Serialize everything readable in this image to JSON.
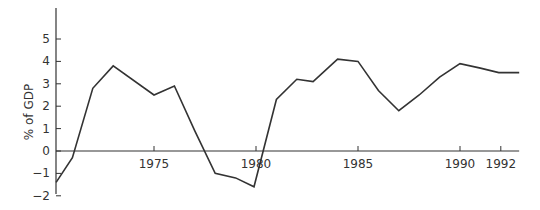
{
  "chart_data": {
    "type": "line",
    "title": "",
    "xlabel": "",
    "ylabel": "% of GDP",
    "xlim": [
      1970.2,
      1992.9
    ],
    "ylim": [
      -2,
      5.6
    ],
    "grid": false,
    "legend": null,
    "x_ticks": [
      1975,
      1980,
      1985,
      1990,
      1992
    ],
    "x_tick_labels": [
      "1975",
      "1980",
      "1985",
      "1990",
      "1992"
    ],
    "y_ticks": [
      -2,
      -1,
      0,
      1,
      2,
      3,
      4,
      5
    ],
    "y_tick_labels": [
      "-2",
      "-1",
      "0",
      "1",
      "2",
      "3",
      "4",
      "5"
    ],
    "zero_line": true,
    "series": [
      {
        "name": "% of GDP",
        "color": "#333333",
        "x": [
          1970.2,
          1971,
          1972,
          1973,
          1975,
          1976,
          1977,
          1978,
          1979,
          1979.9,
          1981,
          1982,
          1982.8,
          1984,
          1985,
          1986,
          1987,
          1988,
          1989,
          1990,
          1991,
          1991.9,
          1992.9
        ],
        "values": [
          -1.4,
          -0.3,
          2.8,
          3.8,
          2.5,
          2.9,
          0.9,
          -1.0,
          -1.2,
          -1.6,
          2.3,
          3.2,
          3.1,
          4.1,
          4.0,
          2.7,
          1.8,
          2.5,
          3.3,
          3.9,
          3.7,
          3.5,
          3.5
        ]
      }
    ]
  }
}
